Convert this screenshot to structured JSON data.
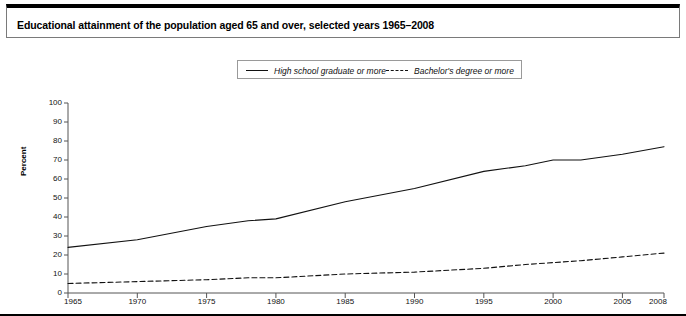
{
  "title": "Educational attainment of the population aged 65 and over, selected years 1965–2008",
  "legend": {
    "position": "top-center",
    "entries": [
      {
        "label": "High school graduate or more",
        "style": "solid",
        "color": "#111111"
      },
      {
        "label": "Bachelor's degree or more",
        "style": "dashed",
        "color": "#111111"
      }
    ]
  },
  "axes": {
    "ylabel": "Percent",
    "yticks": [
      "100",
      "90",
      "80",
      "70",
      "60",
      "50",
      "40",
      "30",
      "20",
      "10",
      "0"
    ],
    "xticks": [
      "1965",
      "1970",
      "1975",
      "1980",
      "1985",
      "1990",
      "1995",
      "2000",
      "2005",
      "2008"
    ]
  },
  "chart_data": {
    "type": "line",
    "title": "Educational attainment of the population aged 65 and over, selected years 1965–2008",
    "xlabel": "",
    "ylabel": "Percent",
    "xlim": [
      1965,
      2008
    ],
    "ylim": [
      0,
      100
    ],
    "grid": false,
    "legend_position": "top-center",
    "x": [
      1965,
      1970,
      1975,
      1978,
      1980,
      1985,
      1990,
      1995,
      1998,
      2000,
      2002,
      2005,
      2008
    ],
    "series": [
      {
        "name": "High school graduate or more",
        "style": "solid",
        "color": "#111111",
        "values": [
          24,
          28,
          35,
          38,
          39,
          48,
          55,
          64,
          67,
          70,
          70,
          73,
          77
        ]
      },
      {
        "name": "Bachelor's degree or more",
        "style": "dashed",
        "color": "#111111",
        "values": [
          5,
          6,
          7,
          8,
          8,
          10,
          11,
          13,
          15,
          16,
          17,
          19,
          21
        ]
      }
    ]
  }
}
